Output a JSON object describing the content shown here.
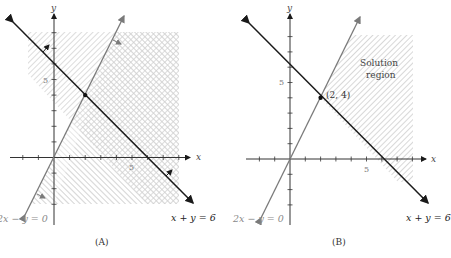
{
  "figure": {
    "panels": [
      {
        "id": "A",
        "caption": "(A)",
        "x_axis_label": "x",
        "y_axis_label": "y",
        "x_tick_label": "5",
        "y_tick_label": "5",
        "line1_label": "x + y = 6",
        "line2_label": "2x − y = 0",
        "shading": "each inequality's half-plane hatched separately; overlap shows cross-hatch"
      },
      {
        "id": "B",
        "caption": "(B)",
        "x_axis_label": "x",
        "y_axis_label": "y",
        "x_tick_label": "5",
        "y_tick_label": "5",
        "line1_label": "x + y = 6",
        "line2_label": "2x − y = 0",
        "point_label": "(2, 4)",
        "region_label_line1": "Solution",
        "region_label_line2": "region"
      }
    ],
    "colors": {
      "line_xy6": "#1a1a1a",
      "line_2x_y": "#7a7a7a",
      "hatch": "#bdbdbd",
      "axis": "#333333",
      "label_gray": "#8a8a8a"
    }
  }
}
